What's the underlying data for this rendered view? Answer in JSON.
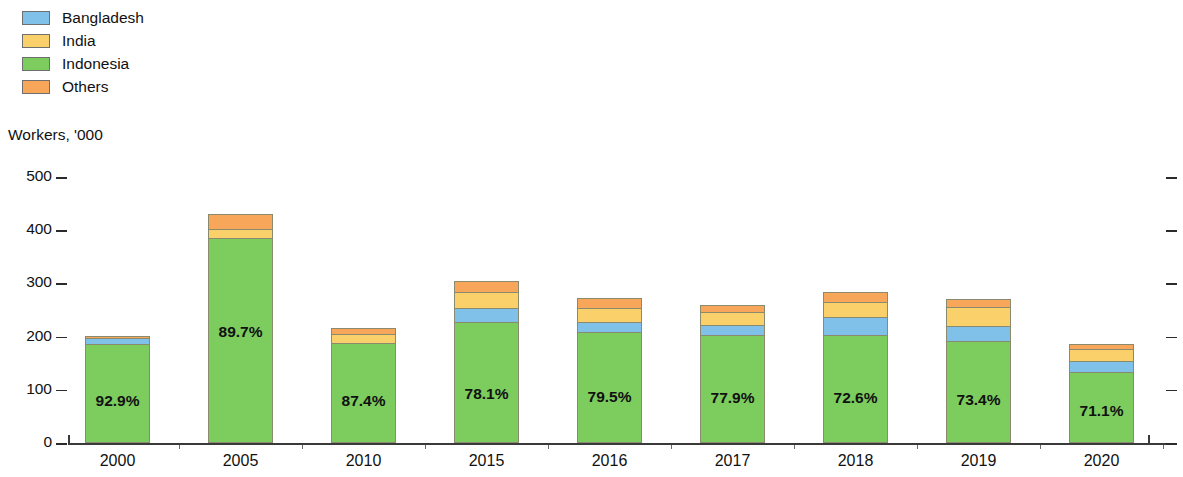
{
  "legend": {
    "items": [
      {
        "label": "Bangladesh",
        "color": "#7FC1E8",
        "key": "bangladesh"
      },
      {
        "label": "India",
        "color": "#FAD06A",
        "key": "india"
      },
      {
        "label": "Indonesia",
        "color": "#7DCC5E",
        "key": "indonesia"
      },
      {
        "label": "Others",
        "color": "#F7A65A",
        "key": "others"
      }
    ]
  },
  "axis_title": "Workers, '000",
  "chart_data": {
    "type": "bar",
    "title": "",
    "subtitle": "",
    "xlabel": "",
    "ylabel": "Workers, '000",
    "ylim": [
      0,
      500
    ],
    "yticks": [
      0,
      100,
      200,
      300,
      400,
      500
    ],
    "grid": false,
    "stacked": true,
    "legend_position": "top-left",
    "categories": [
      "2000",
      "2005",
      "2010",
      "2015",
      "2016",
      "2017",
      "2018",
      "2019",
      "2020"
    ],
    "series": [
      {
        "name": "Indonesia",
        "color": "#7DCC5E",
        "values": [
          186,
          385,
          188,
          228,
          208,
          203,
          203,
          192,
          133
        ]
      },
      {
        "name": "Bangladesh",
        "color": "#7FC1E8",
        "values": [
          11,
          0,
          0,
          26,
          19,
          19,
          33,
          28,
          22
        ]
      },
      {
        "name": "India",
        "color": "#FAD06A",
        "values": [
          0,
          18,
          17,
          30,
          26,
          24,
          30,
          36,
          22
        ]
      },
      {
        "name": "Others",
        "color": "#F7A65A",
        "values": [
          5,
          27,
          11,
          21,
          20,
          13,
          18,
          15,
          10
        ]
      }
    ],
    "totals": [
      202,
      430,
      216,
      305,
      273,
      259,
      284,
      271,
      187
    ],
    "data_labels": [
      "92.9%",
      "89.7%",
      "87.4%",
      "78.1%",
      "79.5%",
      "77.9%",
      "72.6%",
      "73.4%",
      "71.1%"
    ],
    "data_label_note": "Indonesia share of total"
  },
  "yticks": [
    "500",
    "400",
    "300",
    "200",
    "100",
    "0"
  ]
}
